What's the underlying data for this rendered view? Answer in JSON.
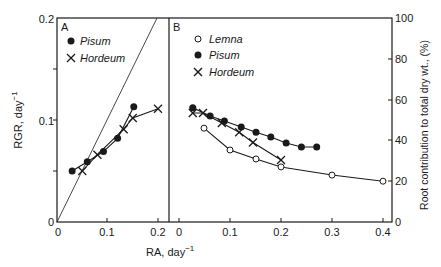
{
  "chart_data": [
    {
      "panel": "A",
      "type": "line",
      "xlabel": "RA, day",
      "xlabel_sup": "-1",
      "ylabel": "RGR, day",
      "ylabel_sup": "-1",
      "xlim": [
        0,
        0.2
      ],
      "ylim": [
        0,
        0.2
      ],
      "x_ticks": [
        "0",
        "0.1",
        "0.2"
      ],
      "y_ticks": [
        "0",
        "0.1",
        "0.2"
      ],
      "reference_line": {
        "label": "1:1",
        "x": [
          0,
          0.2
        ],
        "y": [
          0,
          0.2
        ]
      },
      "legend": [
        {
          "name": "Pisum",
          "marker": "filled-circle"
        },
        {
          "name": "Hordeum",
          "marker": "x"
        }
      ],
      "series": [
        {
          "name": "Pisum",
          "marker": "filled-circle",
          "x": [
            0.03,
            0.06,
            0.092,
            0.12,
            0.152
          ],
          "y": [
            0.05,
            0.059,
            0.069,
            0.082,
            0.113
          ]
        },
        {
          "name": "Hordeum",
          "marker": "x",
          "x": [
            0.05,
            0.08,
            0.132,
            0.15,
            0.2
          ],
          "y": [
            0.05,
            0.066,
            0.091,
            0.102,
            0.111
          ]
        }
      ]
    },
    {
      "panel": "B",
      "type": "line",
      "xlabel": "RA, day",
      "xlabel_sup": "-1",
      "ylabel": "Root contribution to total dry wt., (%)",
      "xlim": [
        0,
        0.4
      ],
      "ylim": [
        0,
        100
      ],
      "x_ticks": [
        "0",
        "0.1",
        "0.2",
        "0.3",
        "0.4"
      ],
      "y_ticks": [
        "0",
        "20",
        "40",
        "60",
        "80",
        "100"
      ],
      "legend": [
        {
          "name": "Lemna",
          "marker": "open-circle"
        },
        {
          "name": "Pisum",
          "marker": "filled-circle"
        },
        {
          "name": "Hordeum",
          "marker": "x"
        }
      ],
      "series": [
        {
          "name": "Lemna",
          "marker": "open-circle",
          "x": [
            0.049,
            0.1,
            0.151,
            0.2,
            0.3,
            0.4
          ],
          "y": [
            46,
            35.3,
            30.9,
            27,
            23,
            20
          ]
        },
        {
          "name": "Pisum",
          "marker": "filled-circle",
          "x": [
            0.027,
            0.061,
            0.089,
            0.122,
            0.151,
            0.18,
            0.21,
            0.24,
            0.27
          ],
          "y": [
            56,
            52,
            49.5,
            46.6,
            44,
            41.7,
            38.7,
            36.8,
            36.8
          ]
        },
        {
          "name": "Hordeum",
          "marker": "x",
          "x": [
            0.027,
            0.047,
            0.084,
            0.118,
            0.145,
            0.2
          ],
          "y": [
            53.4,
            53.4,
            48.5,
            44,
            39,
            30.4
          ]
        }
      ]
    }
  ],
  "labels": {
    "panel_a": "A",
    "panel_b": "B",
    "xlabel": "RA, day",
    "xlabel_sup": "−1",
    "ylabel_left": "RGR, day",
    "ylabel_left_sup": "−1",
    "ylabel_right": "Root contribution to total dry wt., (%)",
    "legend_a": [
      "Pisum",
      "Hordeum"
    ],
    "legend_b": [
      "Lemna",
      "Pisum",
      "Hordeum"
    ]
  },
  "colors": {
    "ink": "#1a1a1a",
    "background": "#ffffff"
  }
}
